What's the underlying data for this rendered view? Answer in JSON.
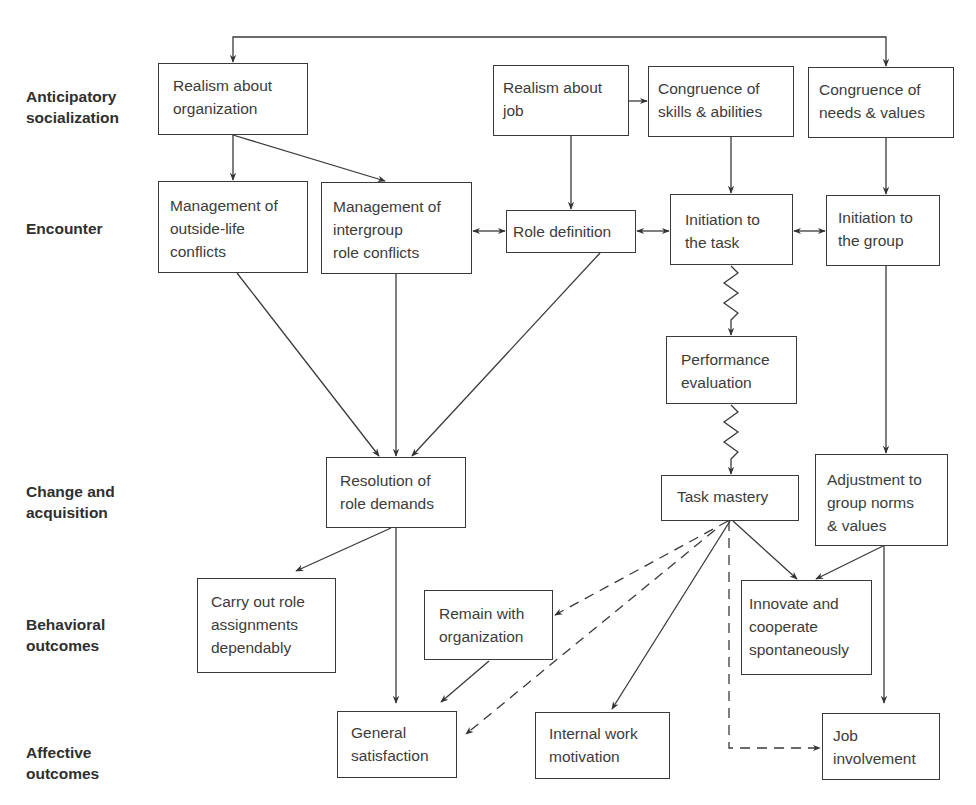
{
  "stages": [
    {
      "id": "anticipatory",
      "label": "Anticipatory\nsocialization"
    },
    {
      "id": "encounter",
      "label": "Encounter"
    },
    {
      "id": "change",
      "label": "Change and\nacquisition"
    },
    {
      "id": "behavioral",
      "label": "Behavioral\noutcomes"
    },
    {
      "id": "affective",
      "label": "Affective\noutcomes"
    }
  ],
  "nodes": {
    "realism_org": "Realism about\norganization",
    "realism_job": "Realism about\njob",
    "congruence_skills": "Congruence of\nskills & abilities",
    "congruence_needs": "Congruence of\nneeds & values",
    "mgmt_outside": "Management of\noutside-life\nconflicts",
    "mgmt_intergroup": "Management of\nintergroup\nrole conflicts",
    "role_definition": "Role definition",
    "init_task": "Initiation to\nthe task",
    "init_group": "Initiation to\nthe group",
    "performance_eval": "Performance\nevaluation",
    "task_mastery": "Task mastery",
    "adjustment": "Adjustment to\ngroup norms\n& values",
    "resolution": "Resolution of\nrole demands",
    "carry_out": "Carry out role\nassignments\ndependably",
    "remain": "Remain with\norganization",
    "innovate": "Innovate and\ncooperate\nspontaneously",
    "general_sat": "General\nsatisfaction",
    "internal_motivation": "Internal work\nmotivation",
    "job_involvement": "Job\ninvolvement"
  },
  "edges": [
    {
      "from": "realism_org",
      "to": "congruence_needs",
      "style": "solid",
      "via": "top feedback loop"
    },
    {
      "from": "realism_org",
      "to": "mgmt_outside",
      "style": "solid"
    },
    {
      "from": "realism_org",
      "to": "mgmt_intergroup",
      "style": "solid"
    },
    {
      "from": "realism_job",
      "to": "congruence_skills",
      "style": "solid"
    },
    {
      "from": "realism_job",
      "to": "role_definition",
      "style": "solid"
    },
    {
      "from": "congruence_skills",
      "to": "init_task",
      "style": "solid"
    },
    {
      "from": "congruence_needs",
      "to": "init_group",
      "style": "solid"
    },
    {
      "from": "mgmt_intergroup",
      "to": "role_definition",
      "style": "bidirectional"
    },
    {
      "from": "role_definition",
      "to": "init_task",
      "style": "bidirectional"
    },
    {
      "from": "init_task",
      "to": "init_group",
      "style": "bidirectional"
    },
    {
      "from": "init_task",
      "to": "performance_eval",
      "style": "zigzag"
    },
    {
      "from": "performance_eval",
      "to": "task_mastery",
      "style": "zigzag"
    },
    {
      "from": "init_group",
      "to": "adjustment",
      "style": "solid"
    },
    {
      "from": "mgmt_outside",
      "to": "resolution",
      "style": "solid"
    },
    {
      "from": "mgmt_intergroup",
      "to": "resolution",
      "style": "solid"
    },
    {
      "from": "role_definition",
      "to": "resolution",
      "style": "solid"
    },
    {
      "from": "resolution",
      "to": "carry_out",
      "style": "solid"
    },
    {
      "from": "resolution",
      "to": "general_sat",
      "style": "solid"
    },
    {
      "from": "task_mastery",
      "to": "remain",
      "style": "dashed"
    },
    {
      "from": "task_mastery",
      "to": "general_sat",
      "style": "dashed"
    },
    {
      "from": "task_mastery",
      "to": "internal_motivation",
      "style": "solid"
    },
    {
      "from": "task_mastery",
      "to": "innovate",
      "style": "solid"
    },
    {
      "from": "task_mastery",
      "to": "job_involvement",
      "style": "dashed"
    },
    {
      "from": "adjustment",
      "to": "innovate",
      "style": "solid"
    },
    {
      "from": "adjustment",
      "to": "job_involvement",
      "style": "solid"
    },
    {
      "from": "remain",
      "to": "general_sat",
      "style": "solid"
    }
  ]
}
